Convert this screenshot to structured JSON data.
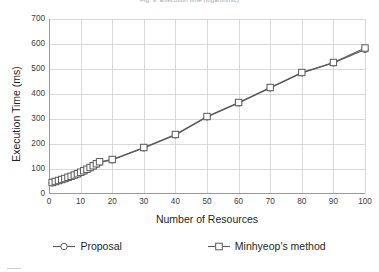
{
  "figure": {
    "caption": "Fig. 9. Execution time (logarithmic)"
  },
  "axes": {
    "ylabel": "Execution Time (ms)",
    "xlabel": "Number of Resources",
    "yticks": [
      "0",
      "100",
      "200",
      "300",
      "400",
      "500",
      "600",
      "700"
    ],
    "xticks": [
      "0",
      "10",
      "20",
      "30",
      "40",
      "50",
      "60",
      "70",
      "80",
      "90",
      "100"
    ]
  },
  "legend": {
    "items": [
      {
        "label": "Proposal",
        "marker": "circle-marker",
        "color": "#595959"
      },
      {
        "label": "Minhyeop's method",
        "marker": "square-marker",
        "color": "#595959"
      }
    ]
  },
  "chart_data": {
    "type": "line",
    "title": "Fig. 9. Execution time (logarithmic)",
    "xlabel": "Number of Resources",
    "ylabel": "Execution Time (ms)",
    "xlim": [
      0,
      100
    ],
    "ylim": [
      0,
      700
    ],
    "xticks": [
      0,
      10,
      20,
      30,
      40,
      50,
      60,
      70,
      80,
      90,
      100
    ],
    "yticks": [
      0,
      100,
      200,
      300,
      400,
      500,
      600,
      700
    ],
    "grid": "both",
    "legend_position": "below",
    "series": [
      {
        "name": "Proposal",
        "marker": "circle",
        "color": "#595959",
        "x": [
          1,
          2,
          3,
          4,
          5,
          6,
          7,
          8,
          9,
          10,
          11,
          12,
          13,
          14,
          15,
          16,
          20,
          30,
          40,
          50,
          60,
          70,
          80,
          90,
          100
        ],
        "y": [
          44,
          48,
          52,
          56,
          60,
          64,
          69,
          73,
          78,
          84,
          90,
          96,
          103,
          110,
          118,
          126,
          136,
          184,
          236,
          308,
          364,
          424,
          484,
          524,
          578
        ]
      },
      {
        "name": "Minhyeop's method",
        "marker": "square",
        "color": "#595959",
        "x": [
          1,
          2,
          3,
          4,
          5,
          6,
          7,
          8,
          9,
          10,
          11,
          12,
          13,
          14,
          15,
          16,
          20,
          30,
          40,
          50,
          60,
          70,
          80,
          90,
          100
        ],
        "y": [
          46,
          50,
          54,
          58,
          62,
          67,
          71,
          76,
          81,
          87,
          93,
          99,
          106,
          113,
          121,
          129,
          138,
          186,
          238,
          310,
          366,
          426,
          486,
          526,
          584
        ]
      }
    ]
  }
}
